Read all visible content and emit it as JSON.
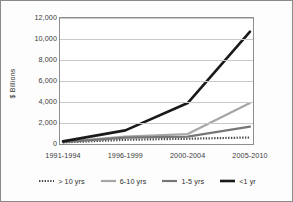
{
  "chart_data": {
    "type": "line",
    "title": "",
    "xlabel": "",
    "ylabel": "$ Billions",
    "categories": [
      "1991-1994",
      "1996-1999",
      "2000-2004",
      "2005-2010"
    ],
    "ylim": [
      0,
      12000
    ],
    "ytick_labels": [
      "0",
      "2,000",
      "4,000",
      "6,000",
      "8,000",
      "10,000",
      "12,000"
    ],
    "ytick_values": [
      0,
      2000,
      4000,
      6000,
      8000,
      10000,
      12000
    ],
    "grid": true,
    "legend_position": "bottom",
    "series": [
      {
        "name": "> 10 yrs",
        "values": [
          150,
          400,
          500,
          620
        ],
        "color": "#4d4d4d",
        "style": "dotted",
        "width": 2.2
      },
      {
        "name": "6-10 yrs",
        "values": [
          200,
          700,
          950,
          3900
        ],
        "color": "#a6a6a6",
        "style": "solid",
        "width": 2.2
      },
      {
        "name": "1-5 yrs",
        "values": [
          180,
          600,
          700,
          1650
        ],
        "color": "#777777",
        "style": "solid",
        "width": 2.2
      },
      {
        "name": "<1 yr",
        "values": [
          250,
          1300,
          3900,
          10700
        ],
        "color": "#1a1a1a",
        "style": "solid",
        "width": 2.6
      }
    ]
  },
  "figure": {
    "background_color": "#fdfdfd",
    "border_color": "#8a8a8a",
    "plot_background": "#ffffff",
    "gridline_color": "#c9c9c9"
  }
}
